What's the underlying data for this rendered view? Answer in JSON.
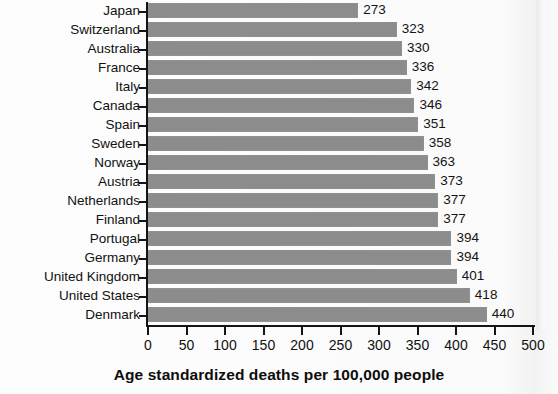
{
  "chart": {
    "type": "bar",
    "orientation": "horizontal",
    "axis_title": "Age standardized deaths per 100,000 people",
    "bar_color": "#8c8c8c",
    "axis_color": "#141414",
    "background": "#fbfbfb"
  },
  "chart_data": {
    "type": "bar",
    "title": "",
    "subtitle": "",
    "xlabel": "Age standardized deaths per 100,000 people",
    "ylabel": "",
    "xlim": [
      0,
      500
    ],
    "xticks": [
      0,
      50,
      100,
      150,
      200,
      250,
      300,
      350,
      400,
      450,
      500
    ],
    "xtick_labels": [
      "0",
      "50",
      "100",
      "150",
      "200",
      "250",
      "300",
      "350",
      "400",
      "450",
      "500"
    ],
    "grid": false,
    "legend": false,
    "orientation": "horizontal",
    "categories": [
      "Japan",
      "Switzerland",
      "Australia",
      "France",
      "Italy",
      "Canada",
      "Spain",
      "Sweden",
      "Norway",
      "Austria",
      "Netherlands",
      "Finland",
      "Portugal",
      "Germany",
      "United Kingdom",
      "United States",
      "Denmark"
    ],
    "values": [
      273,
      323,
      330,
      336,
      342,
      346,
      351,
      358,
      363,
      373,
      377,
      377,
      394,
      394,
      401,
      418,
      440
    ],
    "data_labels": [
      "273",
      "323",
      "330",
      "336",
      "342",
      "346",
      "351",
      "358",
      "363",
      "373",
      "377",
      "377",
      "394",
      "394",
      "401",
      "418",
      "440"
    ]
  }
}
